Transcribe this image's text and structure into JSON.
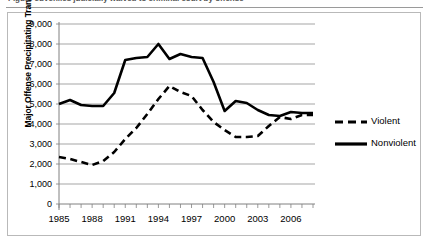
{
  "caption": {
    "partial_text": "Figure  Juveniles judicially waived to criminal court by offense"
  },
  "chart": {
    "ylabel": "Major Offense Precipitating Transfer",
    "xlabel": "",
    "y_tick_labels": [
      "9,000",
      "8,000",
      "7,000",
      "6,000",
      "5,000",
      "4,000",
      "3,000",
      "2,000",
      "1,000",
      "0"
    ],
    "x_tick_labels": [
      "1985",
      "1988",
      "1991",
      "1994",
      "1997",
      "2000",
      "2003",
      "2006"
    ],
    "legend": {
      "items": [
        {
          "label": "Violent",
          "style": "dashed",
          "color": "#000000"
        },
        {
          "label": "Nonviolent",
          "style": "solid",
          "color": "#000000"
        }
      ]
    }
  },
  "chart_data": {
    "type": "line",
    "title": "",
    "xlabel": "",
    "ylabel": "Major Offense Precipitating Transfer",
    "xlim": [
      1985,
      2008
    ],
    "ylim": [
      0,
      9000
    ],
    "ytick_step": 1000,
    "yticks": [
      0,
      1000,
      2000,
      3000,
      4000,
      5000,
      6000,
      7000,
      8000,
      9000
    ],
    "xticks_labeled": [
      1985,
      1988,
      1991,
      1994,
      1997,
      2000,
      2003,
      2006
    ],
    "grid": true,
    "grid_axis": "y",
    "legend_position": "right",
    "x": [
      1985,
      1986,
      1987,
      1988,
      1989,
      1990,
      1991,
      1992,
      1993,
      1994,
      1995,
      1996,
      1997,
      1998,
      1999,
      2000,
      2001,
      2002,
      2003,
      2004,
      2005,
      2006,
      2007,
      2008
    ],
    "series": [
      {
        "name": "Violent",
        "style": "dashed",
        "color": "#000000",
        "values": [
          2350,
          2250,
          2100,
          1950,
          2150,
          2600,
          3250,
          3800,
          4500,
          5250,
          5900,
          5600,
          5400,
          4700,
          4100,
          3700,
          3350,
          3350,
          3400,
          3900,
          4350,
          4250,
          4450,
          4450
        ]
      },
      {
        "name": "Nonviolent",
        "style": "solid",
        "color": "#000000",
        "values": [
          5000,
          5200,
          4950,
          4900,
          4900,
          5550,
          7200,
          7300,
          7350,
          8000,
          7250,
          7500,
          7350,
          7300,
          6100,
          4650,
          5150,
          5050,
          4700,
          4450,
          4400,
          4600,
          4550,
          4550
        ]
      }
    ]
  }
}
